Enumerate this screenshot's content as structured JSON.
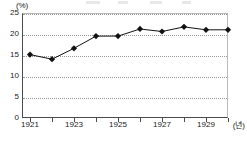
{
  "chart_data": {
    "type": "line",
    "title": "",
    "xlabel": "(년)",
    "ylabel": "(%)",
    "categories": [
      1921,
      1922,
      1923,
      1924,
      1925,
      1926,
      1927,
      1928,
      1929,
      1930
    ],
    "values": [
      15.1,
      14.0,
      16.6,
      19.5,
      19.5,
      21.2,
      20.6,
      21.7,
      21.0,
      21.0
    ],
    "x_tick_labels": [
      "1921",
      "",
      "1923",
      "",
      "1925",
      "",
      "1927",
      "",
      "1929",
      ""
    ],
    "y_ticks": [
      0,
      5,
      10,
      15,
      20,
      25
    ],
    "y_tick_labels": [
      "0",
      "5",
      "10",
      "15",
      "20",
      "25"
    ],
    "ylim": [
      0,
      25
    ],
    "xlim": [
      1921,
      1930
    ],
    "grid": true,
    "grid_axis": "y",
    "legend": false,
    "legend_position": "none",
    "marker": "diamond",
    "series_color": "#111111",
    "grid_color": "#9a9a9a",
    "axis_color": "#4a4a4a",
    "frame_color": "#b9b9b9",
    "background": "#ffffff"
  },
  "axis": {
    "y_unit": "(%)",
    "x_unit": "(년)"
  }
}
